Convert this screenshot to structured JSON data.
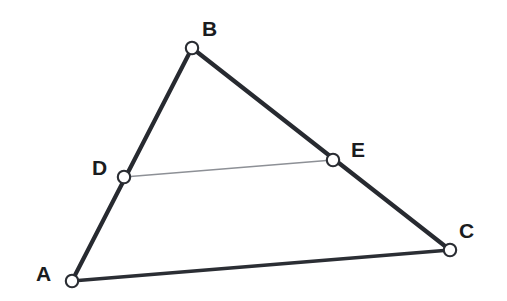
{
  "figure": {
    "background_color": "#ffffff",
    "width": 507,
    "height": 301
  },
  "style": {
    "edge_color": "#272a30",
    "base_edge_color": "#2b2e34",
    "midsegment_color": "#8d9096",
    "vertex_fill": "#ffffff",
    "vertex_stroke": "#2a2d33",
    "label_color": "#1a1c20"
  },
  "points": {
    "A": {
      "label": "A",
      "x": 72,
      "y": 281,
      "label_x": 36,
      "label_y": 263
    },
    "B": {
      "label": "B",
      "x": 192,
      "y": 48,
      "label_x": 202,
      "label_y": 18
    },
    "C": {
      "label": "C",
      "x": 450,
      "y": 250,
      "label_x": 459,
      "label_y": 220
    },
    "D": {
      "label": "D",
      "x": 124,
      "y": 177,
      "label_x": 92,
      "label_y": 157
    },
    "E": {
      "label": "E",
      "x": 333,
      "y": 160,
      "label_x": 351,
      "label_y": 139
    }
  },
  "segments": {
    "AB": {
      "name": "AB",
      "from": "A",
      "to": "B",
      "kind": "thick"
    },
    "BC": {
      "name": "BC",
      "from": "B",
      "to": "C",
      "kind": "thick"
    },
    "AC": {
      "name": "AC",
      "from": "A",
      "to": "C",
      "kind": "base"
    },
    "DE": {
      "name": "DE",
      "from": "D",
      "to": "E",
      "kind": "thin"
    }
  },
  "geometry_paths": {
    "AB": "M 72 281 L 192 48",
    "BC": "M 192 48 L 450 250",
    "AC": "M 72 281 L 450 250",
    "DE": "M 124 177 L 333 160"
  }
}
